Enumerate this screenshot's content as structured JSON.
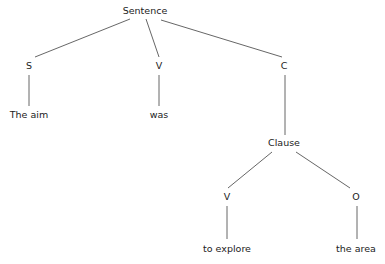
{
  "tree": {
    "nodes": [
      {
        "id": "sentence",
        "label": "Sentence",
        "x": 145,
        "y": 11
      },
      {
        "id": "s",
        "label": "S",
        "x": 29,
        "y": 66
      },
      {
        "id": "v1",
        "label": "V",
        "x": 159,
        "y": 66
      },
      {
        "id": "c",
        "label": "C",
        "x": 284,
        "y": 66
      },
      {
        "id": "the-aim",
        "label": "The aim",
        "x": 29,
        "y": 115
      },
      {
        "id": "was",
        "label": "was",
        "x": 159,
        "y": 115
      },
      {
        "id": "clause",
        "label": "Clause",
        "x": 284,
        "y": 143
      },
      {
        "id": "v2",
        "label": "V",
        "x": 227,
        "y": 197
      },
      {
        "id": "o",
        "label": "O",
        "x": 356,
        "y": 197
      },
      {
        "id": "to-explore",
        "label": "to explore",
        "x": 227,
        "y": 249
      },
      {
        "id": "the-area",
        "label": "the area",
        "x": 356,
        "y": 249
      }
    ],
    "edges": [
      {
        "from": "sentence",
        "to": "s",
        "x1": 130,
        "y1": 19,
        "x2": 35,
        "y2": 57
      },
      {
        "from": "sentence",
        "to": "v1",
        "x1": 146,
        "y1": 19,
        "x2": 159,
        "y2": 57
      },
      {
        "from": "sentence",
        "to": "c",
        "x1": 161,
        "y1": 20,
        "x2": 282,
        "y2": 57
      },
      {
        "from": "s",
        "to": "the-aim",
        "x1": 29,
        "y1": 75,
        "x2": 29,
        "y2": 106
      },
      {
        "from": "v1",
        "to": "was",
        "x1": 159,
        "y1": 75,
        "x2": 159,
        "y2": 106
      },
      {
        "from": "c",
        "to": "clause",
        "x1": 285,
        "y1": 75,
        "x2": 285,
        "y2": 135
      },
      {
        "from": "clause",
        "to": "v2",
        "x1": 272,
        "y1": 152,
        "x2": 228,
        "y2": 188
      },
      {
        "from": "clause",
        "to": "o",
        "x1": 296,
        "y1": 152,
        "x2": 350,
        "y2": 188
      },
      {
        "from": "v2",
        "to": "to-explore",
        "x1": 227,
        "y1": 206,
        "x2": 227,
        "y2": 239
      },
      {
        "from": "o",
        "to": "the-area",
        "x1": 357,
        "y1": 206,
        "x2": 357,
        "y2": 239
      }
    ],
    "line_color": "#555555"
  }
}
